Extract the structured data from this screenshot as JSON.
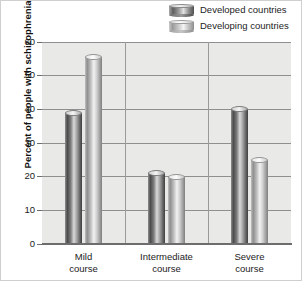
{
  "chart_data": {
    "type": "bar",
    "title": "",
    "subtitle": "",
    "xlabel": "",
    "ylabel": "Percent of people with schizophrenia",
    "categories": [
      "Mild\ncourse",
      "Intermediate\ncourse",
      "Severe\ncourse"
    ],
    "category_lines": [
      [
        "Mild",
        "course"
      ],
      [
        "Intermediate",
        "course"
      ],
      [
        "Severe",
        "course"
      ]
    ],
    "series": [
      {
        "name": "Developed countries",
        "values": [
          39,
          21,
          40
        ],
        "color": "#4b4b4b"
      },
      {
        "name": "Developing countries",
        "values": [
          55.5,
          20,
          25
        ],
        "color": "#9a9a9a"
      }
    ],
    "ylim": [
      0,
      60
    ],
    "yticks": [
      0,
      10,
      20,
      30,
      40,
      50,
      60
    ],
    "ytick_labels": [
      "0",
      "10",
      "20",
      "30",
      "40",
      "50",
      "60"
    ],
    "grid": true,
    "grid_axis": "both",
    "legend": [
      "Developed countries",
      "Developing countries"
    ],
    "legend_position": "top-right",
    "bar_style": "3d-cylinder",
    "plot_background": "#e9e9e7",
    "grid_color": "#8f8f8f"
  },
  "legend": {
    "items": [
      {
        "label": "Developed countries",
        "swatch": "cylinder-dark-icon"
      },
      {
        "label": "Developing countries",
        "swatch": "cylinder-light-icon"
      }
    ]
  },
  "axes": {
    "y_title": "Percent of people with schizophrenia",
    "y_ticks": [
      "60",
      "50",
      "40",
      "30",
      "20",
      "10",
      "0"
    ]
  }
}
